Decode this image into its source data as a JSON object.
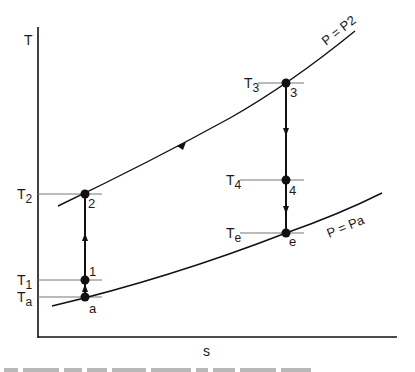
{
  "diagram": {
    "type": "T-s diagram",
    "axes": {
      "y_label": "T",
      "x_label": "s"
    },
    "curves": [
      {
        "id": "upper",
        "label": "P = P2"
      },
      {
        "id": "lower",
        "label": "P = Pa"
      }
    ],
    "points": [
      {
        "id": "a",
        "label": "a",
        "temp_label": "T",
        "temp_sub": "a"
      },
      {
        "id": "1",
        "label": "1",
        "temp_label": "T",
        "temp_sub": "1"
      },
      {
        "id": "2",
        "label": "2",
        "temp_label": "T",
        "temp_sub": "2"
      },
      {
        "id": "3",
        "label": "3",
        "temp_label": "T",
        "temp_sub": "3"
      },
      {
        "id": "4",
        "label": "4",
        "temp_label": "T",
        "temp_sub": "4"
      },
      {
        "id": "e",
        "label": "e",
        "temp_label": "T",
        "temp_sub": "e"
      }
    ],
    "processes": [
      {
        "from": "a",
        "to": "1",
        "direction": "up"
      },
      {
        "from": "1",
        "to": "2",
        "direction": "up"
      },
      {
        "from": "2",
        "to": "3",
        "direction": "along P = P2"
      },
      {
        "from": "3",
        "to": "4",
        "direction": "down"
      },
      {
        "from": "4",
        "to": "e",
        "direction": "down"
      }
    ],
    "colors": {
      "line": "#111111",
      "guide": "#777777"
    }
  }
}
